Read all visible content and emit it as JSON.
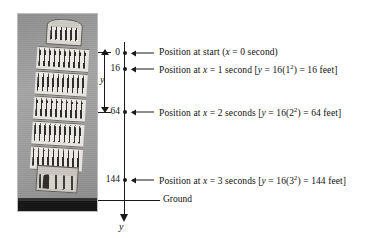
{
  "figure": {
    "photo_alt": "Leaning Tower of Pisa",
    "axis": {
      "label": "y",
      "direction": "down",
      "name": "y-axis"
    },
    "dimension": {
      "label": "y",
      "from_value": "0",
      "to_value": "64"
    },
    "ground": {
      "label": "Ground"
    },
    "ticks": [
      {
        "value": "0",
        "caption_plain": "Position at start (x = 0 second)",
        "caption_parts": {
          "lead": "Position at start (",
          "var1": "x",
          "mid": " = 0 second)"
        }
      },
      {
        "value": "16",
        "caption_plain": "Position at x = 1 second [y = 16(1^2) = 16 feet]",
        "caption_parts": {
          "lead": "Position at ",
          "var1": "x",
          "mid": " = 1 second [",
          "var2": "y",
          "mid2": " = 16(1",
          "exp": "2",
          "tail": ") = 16 feet]"
        }
      },
      {
        "value": "64",
        "caption_plain": "Position at x = 2 seconds [y = 16(2^2) = 64 feet]",
        "caption_parts": {
          "lead": "Position at ",
          "var1": "x",
          "mid": " = 2 seconds [",
          "var2": "y",
          "mid2": " = 16(2",
          "exp": "2",
          "tail": ") = 64 feet]"
        }
      },
      {
        "value": "144",
        "caption_plain": "Position at x = 3 seconds [y = 16(3^2) = 144 feet]",
        "caption_parts": {
          "lead": "Position at ",
          "var1": "x",
          "mid": " = 3 seconds [",
          "var2": "y",
          "mid2": " = 16(3",
          "exp": "2",
          "tail": ") = 144 feet]"
        }
      }
    ],
    "colors": {
      "ink": "#1a1a1a",
      "background": "#ffffff",
      "photo_tone": "#9a9a9a"
    }
  }
}
